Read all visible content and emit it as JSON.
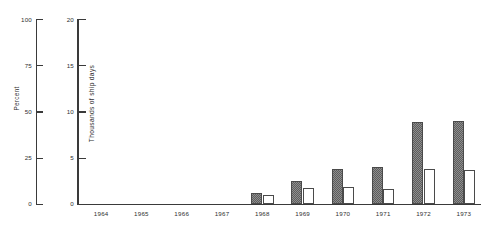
{
  "chart_data": {
    "type": "bar",
    "title": "",
    "subtitle": "",
    "xlabel": "",
    "ylabel": "Thousands of ship days",
    "secondary_ylabel": "Percent",
    "categories": [
      "1964",
      "1965",
      "1966",
      "1967",
      "1968",
      "1969",
      "1970",
      "1971",
      "1972",
      "1973"
    ],
    "series": [
      {
        "name": "shaded-bar",
        "style": "hatched-gray",
        "values": [
          0,
          0,
          0,
          0,
          1.2,
          2.5,
          3.8,
          4.0,
          8.9,
          9.0
        ]
      },
      {
        "name": "open-bar",
        "style": "white-outline",
        "values": [
          0,
          0,
          0,
          0,
          1.0,
          1.7,
          1.8,
          1.6,
          3.8,
          3.7
        ]
      }
    ],
    "ylim": [
      0,
      20
    ],
    "yticks": [
      0,
      5,
      10,
      15,
      20
    ],
    "secondary_ylim": [
      0,
      100
    ],
    "secondary_yticks": [
      0,
      25,
      50,
      75,
      100
    ],
    "grid": false,
    "legend": "none",
    "legend_position": "none"
  },
  "axes": {
    "percent": {
      "title": "Percent",
      "ticks": [
        {
          "value": 100,
          "label": "100"
        },
        {
          "value": 75,
          "label": "75"
        },
        {
          "value": 50,
          "label": "50"
        },
        {
          "value": 25,
          "label": "25"
        },
        {
          "value": 0,
          "label": "0"
        }
      ]
    },
    "ship_days": {
      "title": "Thousands of ship days",
      "ticks": [
        {
          "value": 20,
          "label": "20"
        },
        {
          "value": 15,
          "label": "15"
        },
        {
          "value": 10,
          "label": "10"
        },
        {
          "value": 5,
          "label": "5"
        },
        {
          "value": 0,
          "label": "0"
        }
      ]
    }
  },
  "colors": {
    "axis": "#3a3a3a",
    "bar_shaded_fill": "#8e8e8e",
    "bar_shaded_hatch": "#5d5d5d",
    "bar_open_fill": "#ffffff",
    "bar_outline": "#4a4a4a",
    "background": "#ffffff",
    "text": "#2f2f2f"
  }
}
